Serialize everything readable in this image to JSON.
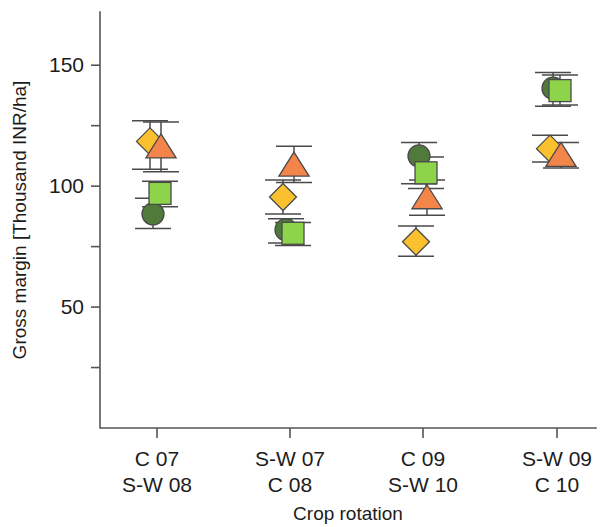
{
  "chart_data": {
    "type": "scatter",
    "title": "",
    "xlabel": "Crop rotation",
    "ylabel": "Gross margin [Thousand INR/ha]",
    "categories": [
      "C 07\nS-W 08",
      "S-W 07\nC 08",
      "C 09\nS-W 10",
      "S-W 09\nC 10"
    ],
    "category_lines": [
      [
        "C 07",
        "S-W 08"
      ],
      [
        "S-W 07",
        "C 08"
      ],
      [
        "C 09",
        "S-W 10"
      ],
      [
        "S-W 09",
        "C 10"
      ]
    ],
    "ylim": [
      0,
      172
    ],
    "y_ticks_labeled": [
      50,
      100,
      150
    ],
    "y_ticks_unlabeled": [
      25,
      75,
      125
    ],
    "y_tick_labels": [
      "50",
      "100",
      "150"
    ],
    "grid": false,
    "legend": "none",
    "series": [
      {
        "name": "dark-green-circle",
        "marker": "circle",
        "color": "#4f7a3a",
        "values": [
          88.5,
          82.0,
          112.5,
          140.5
        ],
        "err_low": [
          82.5,
          76.5,
          101.0,
          133.0
        ],
        "err_high": [
          95.0,
          86.5,
          118.0,
          147.0
        ]
      },
      {
        "name": "light-green-square",
        "marker": "square",
        "color": "#8ed44a",
        "values": [
          97.0,
          80.5,
          105.5,
          139.5
        ],
        "err_low": [
          91.5,
          75.5,
          99.0,
          133.5
        ],
        "err_high": [
          102.0,
          85.0,
          112.0,
          146.0
        ]
      },
      {
        "name": "orange-triangle",
        "marker": "triangle",
        "color": "#f4854a",
        "values": [
          116.0,
          108.5,
          95.0,
          112.5
        ],
        "err_low": [
          106.0,
          101.5,
          88.0,
          107.5
        ],
        "err_high": [
          126.5,
          116.5,
          102.5,
          118.0
        ]
      },
      {
        "name": "yellow-diamond",
        "marker": "diamond",
        "color": "#fbc02d",
        "values": [
          118.5,
          95.5,
          77.0,
          115.5
        ],
        "err_low": [
          107.0,
          88.5,
          71.0,
          110.0
        ],
        "err_high": [
          127.0,
          102.5,
          83.5,
          121.0
        ]
      }
    ],
    "colors": {
      "dark_green": "#4f7a3a",
      "light_green": "#8ed44a",
      "orange": "#f4854a",
      "yellow": "#fbc02d",
      "axis": "#555555",
      "marker_outline": "#4a4a4a",
      "background": "#ffffff"
    },
    "annotations": []
  }
}
